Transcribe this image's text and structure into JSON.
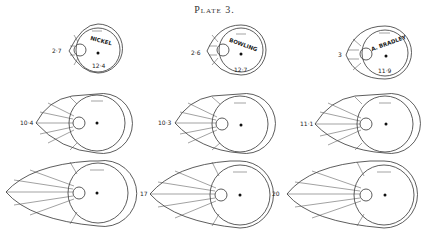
{
  "plate": {
    "title": "Plate 3."
  },
  "rows": [
    {
      "diagrams": [
        {
          "id": "nickel",
          "left_value": "2·7",
          "name": "NICKEL",
          "ball_value": "12·4"
        },
        {
          "id": "bowling",
          "left_value": "2·6",
          "name": "BOWLING",
          "ball_value": "12·7"
        },
        {
          "id": "bradley",
          "left_value": "3",
          "name": "A. BRADLEY",
          "ball_value": "11·9"
        }
      ]
    },
    {
      "diagrams": [
        {
          "left_value": "10·4"
        },
        {
          "left_value": "10·3"
        },
        {
          "left_value": "11·1"
        }
      ]
    },
    {
      "diagrams": [
        {
          "left_value": ""
        },
        {
          "left_value": "17"
        },
        {
          "left_value": "20"
        }
      ]
    }
  ]
}
